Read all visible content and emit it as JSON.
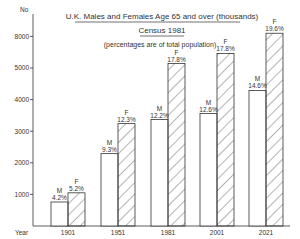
{
  "chart_data": {
    "type": "bar",
    "title": "U.K. Males and Females Age 65 and over (thousands)",
    "subtitle": "Census 1981",
    "note": "(percentages are of total population)",
    "xlabel": "Year",
    "ylabel": "No",
    "categories": [
      "1901",
      "1951",
      "1981",
      "2001",
      "2021"
    ],
    "series": [
      {
        "name": "M",
        "fill": "plain",
        "values": [
          760,
          2290,
          3370,
          3560,
          4290
        ],
        "labels": [
          "4.2%",
          "9.3%",
          "12.2%",
          "12.6%",
          "14.6%"
        ]
      },
      {
        "name": "F",
        "fill": "hatched",
        "values": [
          1050,
          3240,
          5140,
          5460,
          6100
        ],
        "labels": [
          "5.2%",
          "12.3%",
          "17.8%",
          "17.8%",
          "19.6%"
        ]
      }
    ],
    "y_ticks": [
      {
        "value": 1000,
        "label": "1000"
      },
      {
        "value": 2000,
        "label": "2000"
      },
      {
        "value": 3000,
        "label": "3000"
      },
      {
        "value": 4000,
        "label": "4000"
      },
      {
        "value": 5000,
        "label": "5000"
      },
      {
        "value": 6000,
        "label": "8000"
      }
    ],
    "ylim": [
      0,
      6300
    ],
    "grid": false,
    "legend": "inline labels above bars (M = males, F = females)"
  },
  "colors": {
    "line": "#333333",
    "background": "#ffffff"
  }
}
